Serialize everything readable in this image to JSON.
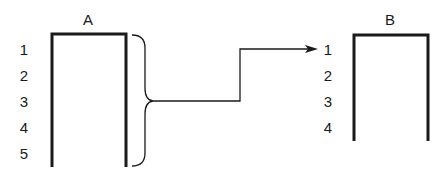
{
  "diagram": {
    "stack_a": {
      "label": "A",
      "rows": [
        "1",
        "2",
        "3",
        "4",
        "5"
      ]
    },
    "stack_b": {
      "label": "B",
      "rows": [
        "1",
        "2",
        "3",
        "4"
      ]
    },
    "connector": {
      "from": "all rows of A (brace)",
      "to": "row 1 of B"
    },
    "colors": {
      "stroke": "#1a1a1a",
      "background": "#ffffff"
    }
  }
}
